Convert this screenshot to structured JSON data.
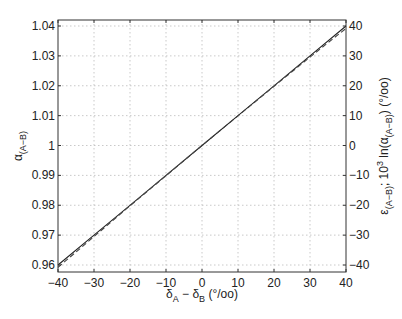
{
  "chart_data": {
    "type": "line",
    "title": "",
    "xlabel": "δA − δB (°/oo)",
    "ylabel_left": "α(A−B)",
    "ylabel_right": "ε(A−B); 10^3 ln(α(A−B)) (°/oo)",
    "xlim": [
      -40,
      40
    ],
    "ylim_left": [
      0.96,
      1.04
    ],
    "ylim_right": [
      -40,
      40
    ],
    "grid": true,
    "legend": null,
    "x_ticks": [
      -40,
      -30,
      -20,
      -10,
      0,
      10,
      20,
      30,
      40
    ],
    "x_tick_labels": [
      "−40",
      "−30",
      "−20",
      "−10",
      "0",
      "10",
      "20",
      "30",
      "40"
    ],
    "y_left_ticks": [
      0.96,
      0.97,
      0.98,
      0.99,
      1,
      1.01,
      1.02,
      1.03,
      1.04
    ],
    "y_left_tick_labels": [
      "0.96",
      "0.97",
      "0.98",
      "0.99",
      "1",
      "1.01",
      "1.02",
      "1.03",
      "1.04"
    ],
    "y_right_ticks": [
      -40,
      -30,
      -20,
      -10,
      0,
      10,
      20,
      30,
      40
    ],
    "y_right_tick_labels": [
      "−40",
      "−30",
      "−20",
      "−10",
      "0",
      "10",
      "20",
      "30",
      "40"
    ],
    "series": [
      {
        "name": "α(A−B)",
        "style": "solid",
        "axis": "left",
        "x": [
          -40,
          -30,
          -20,
          -10,
          0,
          10,
          20,
          30,
          40
        ],
        "values": [
          0.96,
          0.97,
          0.98,
          0.99,
          1.0,
          1.01,
          1.02,
          1.03,
          1.04
        ]
      },
      {
        "name": "10^3 ln(α(A−B))",
        "style": "dashed",
        "axis": "right",
        "x": [
          -40,
          -30,
          -20,
          -10,
          0,
          10,
          20,
          30,
          40
        ],
        "values": [
          -40.8,
          -30.5,
          -20.2,
          -10.1,
          0,
          9.95,
          19.8,
          29.6,
          39.2
        ]
      }
    ]
  },
  "labels": {
    "x_main": "δ",
    "x_sub_a": "A",
    "x_minus": " − δ",
    "x_sub_b": "B",
    "x_units": " (°/oo)",
    "yl_main": "α",
    "yl_sub": "(A−B)",
    "yr_eps": "ε",
    "yr_sub1": "(A−B)",
    "yr_mid": "; 10",
    "yr_sup": "3",
    "yr_ln": " ln(α",
    "yr_sub2": "(A−B)",
    "yr_end": ") (°/oo)"
  }
}
